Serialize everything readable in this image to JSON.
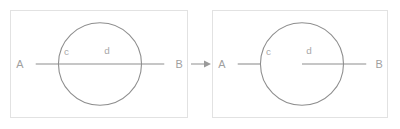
{
  "figure": {
    "type": "geometry-diagram",
    "background_color": "#ffffff",
    "stroke_color": "#8e8e8e",
    "label_color": "#a0a0a0",
    "panel_border_color": "#e2e2e2",
    "panels": [
      {
        "id": "before",
        "labels": {
          "point_a": "A",
          "point_b": "B",
          "segment_c": "c",
          "segment_d": "d"
        },
        "line": {
          "description": "continuous segment from A through circle to B",
          "segments": [
            "A-to-B-unbroken"
          ]
        },
        "circle": {
          "description": "circle centered on line AB"
        }
      },
      {
        "id": "after",
        "labels": {
          "point_a": "A",
          "point_b": "B",
          "segment_c": "c",
          "segment_d": "d"
        },
        "line": {
          "description": "segment A to circle left edge, gap, then circle center to B",
          "segments": [
            "A-to-left-edge",
            "center-to-B"
          ]
        },
        "circle": {
          "description": "circle centered on line AB"
        }
      }
    ],
    "connector": {
      "icon": "right-arrow-icon",
      "color": "#9a9a9a"
    }
  }
}
